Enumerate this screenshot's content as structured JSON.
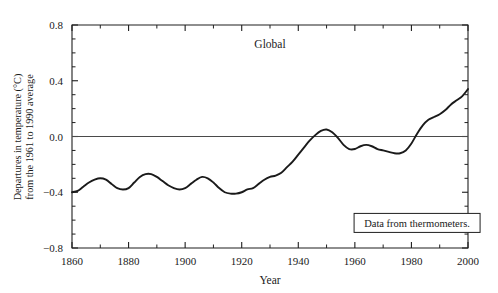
{
  "chart_data": {
    "type": "line",
    "title": "Global",
    "xlabel": "Year",
    "ylabel_line1": "Departures in temperature (°C)",
    "ylabel_line2": "from the 1961 to 1990 average",
    "xlim": [
      1860,
      2000
    ],
    "ylim": [
      -0.8,
      0.8
    ],
    "xticks": [
      1860,
      1880,
      1900,
      1920,
      1940,
      1960,
      1980,
      2000
    ],
    "xtick_labels": [
      "1860",
      "1880",
      "1900",
      "1920",
      "1940",
      "1960",
      "1980",
      "2000"
    ],
    "x_minor_step": 10,
    "yticks": [
      -0.8,
      -0.4,
      0.0,
      0.4,
      0.8
    ],
    "ytick_labels": [
      "−0.8",
      "−0.4",
      "0.0",
      "0.4",
      "0.8"
    ],
    "y_minor_step": 0.1,
    "grid": false,
    "legend": null,
    "zero_reference_line": 0.0,
    "line_color": "#1a1a1a",
    "annotations": [
      {
        "name": "data-source-note",
        "text": "Data from thermometers.",
        "x": 1982,
        "y": -0.62,
        "boxed": true
      }
    ],
    "x": [
      1860,
      1862,
      1864,
      1866,
      1868,
      1870,
      1872,
      1874,
      1876,
      1878,
      1880,
      1882,
      1884,
      1886,
      1888,
      1890,
      1892,
      1894,
      1896,
      1898,
      1900,
      1902,
      1904,
      1906,
      1908,
      1910,
      1912,
      1914,
      1916,
      1918,
      1920,
      1922,
      1924,
      1926,
      1928,
      1930,
      1932,
      1934,
      1936,
      1938,
      1940,
      1942,
      1944,
      1946,
      1948,
      1950,
      1952,
      1954,
      1956,
      1958,
      1960,
      1962,
      1964,
      1966,
      1968,
      1970,
      1972,
      1974,
      1976,
      1978,
      1980,
      1982,
      1984,
      1986,
      1988,
      1990,
      1992,
      1994,
      1996,
      1998,
      2000
    ],
    "values": [
      -0.4,
      -0.39,
      -0.36,
      -0.33,
      -0.31,
      -0.3,
      -0.31,
      -0.34,
      -0.37,
      -0.38,
      -0.37,
      -0.33,
      -0.29,
      -0.27,
      -0.27,
      -0.29,
      -0.32,
      -0.35,
      -0.37,
      -0.38,
      -0.37,
      -0.34,
      -0.31,
      -0.29,
      -0.3,
      -0.33,
      -0.37,
      -0.4,
      -0.41,
      -0.41,
      -0.4,
      -0.38,
      -0.37,
      -0.34,
      -0.31,
      -0.29,
      -0.28,
      -0.26,
      -0.22,
      -0.18,
      -0.13,
      -0.08,
      -0.03,
      0.01,
      0.04,
      0.05,
      0.03,
      -0.01,
      -0.06,
      -0.09,
      -0.09,
      -0.07,
      -0.06,
      -0.07,
      -0.09,
      -0.1,
      -0.11,
      -0.12,
      -0.12,
      -0.1,
      -0.05,
      0.02,
      0.08,
      0.12,
      0.14,
      0.16,
      0.19,
      0.23,
      0.26,
      0.29,
      0.34
    ],
    "notes": {
      "series_name": "Global mean surface temperature anomaly",
      "peak_1940s": 0.05,
      "min_start": -0.41,
      "end_value": 0.34
    }
  },
  "axes_geometry": {
    "plot_left": 72,
    "plot_right": 468,
    "plot_top": 25,
    "plot_bottom": 248
  }
}
